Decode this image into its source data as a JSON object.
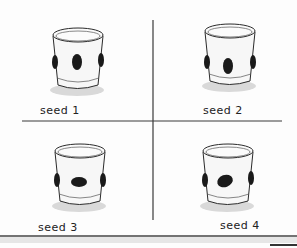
{
  "figure": {
    "colors": {
      "ink": "#2a2a2a",
      "seed": "#1a1a1a",
      "shadow": "#d8d8d8",
      "cup_fill": "#f7f7f7"
    },
    "panels": [
      {
        "label": "seed 1",
        "seed_icon": "bean-seed-vertical"
      },
      {
        "label": "seed 2",
        "seed_icon": "bean-seed-vertical"
      },
      {
        "label": "seed 3",
        "seed_icon": "bean-seed-horizontal"
      },
      {
        "label": "seed 4",
        "seed_icon": "bean-seed-tilted"
      }
    ]
  }
}
